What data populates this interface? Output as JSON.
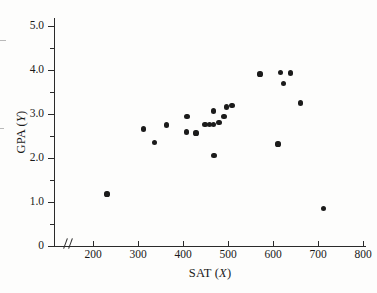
{
  "chart_data": {
    "type": "scatter",
    "title": "",
    "xlabel": "SAT (X)",
    "ylabel": "GPA (Y)",
    "xlim": [
      140,
      830
    ],
    "ylim": [
      0,
      5.2
    ],
    "grid": false,
    "legend": null,
    "axis_break_x": true,
    "xticks": [
      200,
      300,
      400,
      500,
      600,
      700,
      800
    ],
    "xtick_labels": [
      "200",
      "300",
      "400",
      "500",
      "600",
      "700",
      "800"
    ],
    "yticks": [
      0,
      1.0,
      2.0,
      3.0,
      4.0,
      5.0
    ],
    "ytick_labels": [
      "0",
      "1.0",
      "2.0",
      "3.0",
      "4.0",
      "5.0"
    ],
    "yticks_minor": [
      0.5,
      1.5,
      2.5,
      3.5,
      4.5
    ],
    "marker": "filled-circle",
    "marker_color": "#1b1b1b",
    "n_points": 23,
    "points": [
      {
        "x": 231,
        "y": 1.18
      },
      {
        "x": 313,
        "y": 2.66
      },
      {
        "x": 336,
        "y": 2.36
      },
      {
        "x": 364,
        "y": 2.75
      },
      {
        "x": 407,
        "y": 2.59
      },
      {
        "x": 409,
        "y": 2.95
      },
      {
        "x": 429,
        "y": 2.57
      },
      {
        "x": 449,
        "y": 2.77
      },
      {
        "x": 458,
        "y": 2.77
      },
      {
        "x": 467,
        "y": 2.77
      },
      {
        "x": 467,
        "y": 3.07
      },
      {
        "x": 469,
        "y": 2.05
      },
      {
        "x": 480,
        "y": 2.8
      },
      {
        "x": 491,
        "y": 2.95
      },
      {
        "x": 496,
        "y": 3.16
      },
      {
        "x": 509,
        "y": 3.2
      },
      {
        "x": 571,
        "y": 3.91
      },
      {
        "x": 611,
        "y": 2.32
      },
      {
        "x": 616,
        "y": 3.95
      },
      {
        "x": 624,
        "y": 3.7
      },
      {
        "x": 638,
        "y": 3.93
      },
      {
        "x": 662,
        "y": 3.25
      },
      {
        "x": 713,
        "y": 0.86
      }
    ]
  },
  "axis_label_parts": {
    "x_prefix": "SAT (",
    "x_var": "X",
    "x_suffix": ")",
    "y_prefix": "GPA (",
    "y_var": "Y",
    "y_suffix": ")"
  }
}
